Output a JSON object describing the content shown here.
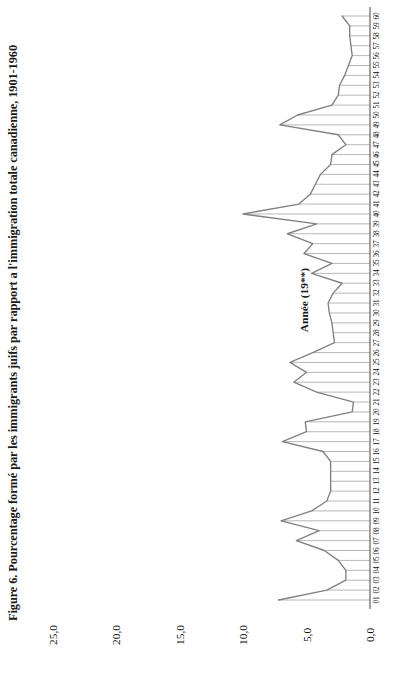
{
  "figure": {
    "title": "Figure 6. Pourcentage formé par les immigrants juifs par rapport a l'immigration totale canadienne, 1901-1960",
    "category_axis_title": "Année (19**)"
  },
  "chart_data": {
    "type": "line",
    "orientation": "rotated-90-ccw",
    "title": "Figure 6. Pourcentage formé par les immigrants juifs par rapport a l'immigration totale canadienne, 1901-1960",
    "xlabel": "Année (19**)",
    "ylabel": "",
    "ylim": [
      0,
      25
    ],
    "yticks": [
      "0,0",
      "5,0",
      "10,0",
      "15,0",
      "20,0",
      "25,0"
    ],
    "ytick_values": [
      0,
      5,
      10,
      15,
      20,
      25
    ],
    "grid": true,
    "legend": "none",
    "categories": [
      "01",
      "02",
      "03",
      "04",
      "05",
      "06",
      "07",
      "08",
      "09",
      "10",
      "11",
      "12",
      "13",
      "14",
      "15",
      "16",
      "17",
      "18",
      "19",
      "20",
      "21",
      "22",
      "23",
      "24",
      "25",
      "26",
      "27",
      "28",
      "29",
      "30",
      "31",
      "32",
      "33",
      "34",
      "35",
      "36",
      "37",
      "38",
      "39",
      "40",
      "41",
      "42",
      "43",
      "44",
      "45",
      "46",
      "47",
      "48",
      "49",
      "50",
      "51",
      "52",
      "53",
      "54",
      "55",
      "56",
      "57",
      "58",
      "59",
      "60"
    ],
    "values": [
      7.2,
      3.4,
      1.9,
      1.9,
      2.5,
      3.6,
      5.8,
      4.0,
      7.0,
      4.6,
      3.4,
      3.1,
      3.1,
      3.1,
      3.1,
      3.7,
      6.9,
      5.0,
      5.1,
      1.4,
      1.3,
      4.2,
      6.0,
      5.0,
      6.3,
      4.5,
      2.8,
      2.9,
      3.0,
      3.2,
      3.3,
      2.9,
      2.2,
      4.6,
      3.0,
      5.2,
      4.5,
      6.5,
      4.2,
      10.0,
      5.6,
      4.7,
      4.3,
      3.9,
      3.1,
      3.0,
      1.9,
      2.5,
      7.1,
      5.7,
      3.0,
      2.5,
      2.4,
      2.0,
      1.7,
      1.4,
      1.5,
      1.6,
      1.6,
      2.2
    ],
    "series": [
      {
        "name": "Pourcentage des immigrants juifs",
        "values": [
          7.2,
          3.4,
          1.9,
          1.9,
          2.5,
          3.6,
          5.8,
          4.0,
          7.0,
          4.6,
          3.4,
          3.1,
          3.1,
          3.1,
          3.1,
          3.7,
          6.9,
          5.0,
          5.1,
          1.4,
          1.3,
          4.2,
          6.0,
          5.0,
          6.3,
          4.5,
          2.8,
          2.9,
          3.0,
          3.2,
          3.3,
          2.9,
          2.2,
          4.6,
          3.0,
          5.2,
          4.5,
          6.5,
          4.2,
          10.0,
          5.6,
          4.7,
          4.3,
          3.9,
          3.1,
          3.0,
          1.9,
          2.5,
          7.1,
          5.7,
          3.0,
          2.5,
          2.4,
          2.0,
          1.7,
          1.4,
          1.5,
          1.6,
          1.6,
          2.2
        ]
      }
    ],
    "colors": {
      "line": "#808080",
      "grid": "#999999",
      "axis": "#555555",
      "text": "#111111"
    }
  },
  "value_axis_labels": [
    "25,0",
    "20,0",
    "15,0",
    "10,0",
    "5,0",
    "0,0"
  ]
}
